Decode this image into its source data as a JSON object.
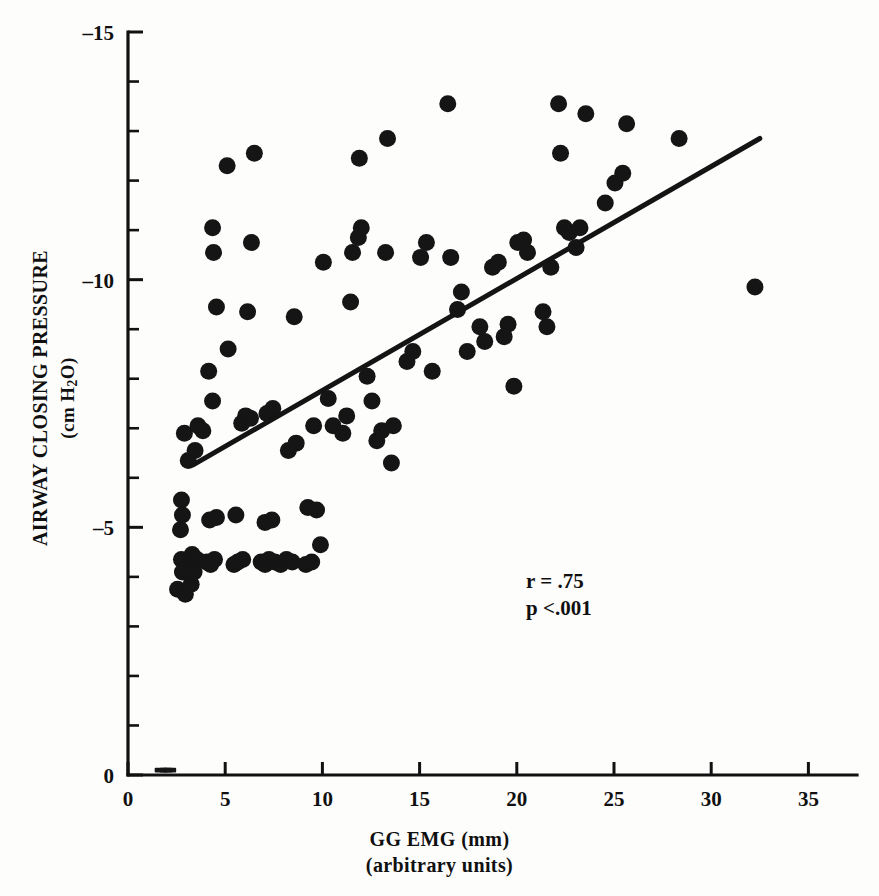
{
  "chart_data": {
    "type": "scatter",
    "title": "",
    "xlabel": "GG EMG (mm)",
    "xlabel_line2": "(arbitrary units)",
    "ylabel": "AIRWAY CLOSING PRESSURE",
    "ylabel_line2": "(cm H2O)",
    "ylabel_line2_pre": "(cm H",
    "ylabel_line2_sub": "2",
    "ylabel_line2_post": "O)",
    "xlim": [
      0,
      37.5
    ],
    "ylim": [
      -15,
      0
    ],
    "grid": false,
    "legend": null,
    "xticks": [
      0,
      5,
      10,
      15,
      20,
      25,
      30,
      35
    ],
    "xtick_labels": [
      "0",
      "5",
      "10",
      "15",
      "20",
      "25",
      "30",
      "35"
    ],
    "x_minor_step": 1,
    "yticks": [
      -15,
      -10,
      -5,
      0
    ],
    "ytick_labels": [
      "–15",
      "–10",
      "–5",
      "0"
    ],
    "y_minor_step": 1,
    "annotations": [
      {
        "name": "correlation",
        "text": "r = .75"
      },
      {
        "name": "p-value",
        "text": "p <.001"
      }
    ],
    "regression_line": {
      "x_start": 3.35,
      "y_start": -6.26,
      "x_end": 32.5,
      "y_end": -12.85
    },
    "marker_radius_px": 8.5,
    "point_color": "#151515",
    "line_color": "#141414",
    "points": [
      [
        1.7,
        -0.05
      ],
      [
        1.95,
        -0.05
      ],
      [
        2.15,
        -0.05
      ],
      [
        2.7,
        -4.95
      ],
      [
        2.8,
        -5.25
      ],
      [
        2.75,
        -5.55
      ],
      [
        2.75,
        -4.35
      ],
      [
        2.8,
        -4.1
      ],
      [
        3.05,
        -4.15
      ],
      [
        2.55,
        -3.75
      ],
      [
        2.95,
        -3.65
      ],
      [
        3.25,
        -3.85
      ],
      [
        3.3,
        -4.45
      ],
      [
        3.55,
        -4.35
      ],
      [
        3.4,
        -4.1
      ],
      [
        3.1,
        -6.35
      ],
      [
        3.45,
        -6.55
      ],
      [
        2.9,
        -6.9
      ],
      [
        3.6,
        -7.05
      ],
      [
        3.85,
        -6.95
      ],
      [
        4.05,
        -4.3
      ],
      [
        4.25,
        -4.25
      ],
      [
        4.45,
        -4.35
      ],
      [
        4.2,
        -5.15
      ],
      [
        4.55,
        -5.2
      ],
      [
        4.35,
        -7.55
      ],
      [
        4.15,
        -8.15
      ],
      [
        4.55,
        -9.45
      ],
      [
        4.4,
        -10.55
      ],
      [
        4.35,
        -11.05
      ],
      [
        5.1,
        -12.3
      ],
      [
        5.15,
        -8.6
      ],
      [
        5.45,
        -4.25
      ],
      [
        5.65,
        -4.3
      ],
      [
        5.9,
        -4.35
      ],
      [
        5.55,
        -5.25
      ],
      [
        5.85,
        -7.1
      ],
      [
        6.05,
        -7.25
      ],
      [
        6.3,
        -7.2
      ],
      [
        6.15,
        -9.35
      ],
      [
        6.35,
        -10.75
      ],
      [
        6.5,
        -12.55
      ],
      [
        6.85,
        -4.3
      ],
      [
        7.05,
        -4.25
      ],
      [
        7.25,
        -4.35
      ],
      [
        7.05,
        -5.1
      ],
      [
        7.4,
        -5.15
      ],
      [
        7.15,
        -7.3
      ],
      [
        7.45,
        -7.4
      ],
      [
        7.55,
        -4.3
      ],
      [
        7.85,
        -4.25
      ],
      [
        8.15,
        -4.35
      ],
      [
        8.45,
        -4.3
      ],
      [
        8.25,
        -6.55
      ],
      [
        8.65,
        -6.7
      ],
      [
        8.55,
        -9.25
      ],
      [
        9.15,
        -4.25
      ],
      [
        9.45,
        -4.3
      ],
      [
        9.25,
        -5.4
      ],
      [
        9.7,
        -5.35
      ],
      [
        9.55,
        -7.05
      ],
      [
        9.9,
        -4.65
      ],
      [
        10.05,
        -10.35
      ],
      [
        10.3,
        -7.6
      ],
      [
        10.55,
        -7.05
      ],
      [
        11.05,
        -6.9
      ],
      [
        11.25,
        -7.25
      ],
      [
        11.45,
        -9.55
      ],
      [
        11.55,
        -10.55
      ],
      [
        11.85,
        -10.85
      ],
      [
        12.0,
        -11.05
      ],
      [
        11.9,
        -12.45
      ],
      [
        12.3,
        -8.05
      ],
      [
        12.55,
        -7.55
      ],
      [
        12.8,
        -6.75
      ],
      [
        13.05,
        -6.95
      ],
      [
        13.25,
        -10.55
      ],
      [
        13.35,
        -12.85
      ],
      [
        13.55,
        -6.3
      ],
      [
        13.65,
        -7.05
      ],
      [
        14.35,
        -8.35
      ],
      [
        14.65,
        -8.55
      ],
      [
        15.05,
        -10.45
      ],
      [
        15.35,
        -10.75
      ],
      [
        15.65,
        -8.15
      ],
      [
        16.45,
        -13.55
      ],
      [
        16.6,
        -10.45
      ],
      [
        16.95,
        -9.4
      ],
      [
        17.15,
        -9.75
      ],
      [
        17.45,
        -8.55
      ],
      [
        18.1,
        -9.05
      ],
      [
        18.35,
        -8.75
      ],
      [
        18.75,
        -10.25
      ],
      [
        19.05,
        -10.35
      ],
      [
        19.35,
        -8.85
      ],
      [
        19.55,
        -9.1
      ],
      [
        19.85,
        -7.85
      ],
      [
        20.05,
        -10.75
      ],
      [
        20.35,
        -10.8
      ],
      [
        20.55,
        -10.55
      ],
      [
        21.35,
        -9.35
      ],
      [
        21.55,
        -9.05
      ],
      [
        21.75,
        -10.25
      ],
      [
        22.15,
        -13.55
      ],
      [
        22.25,
        -12.55
      ],
      [
        22.45,
        -11.05
      ],
      [
        22.7,
        -10.95
      ],
      [
        23.05,
        -10.65
      ],
      [
        23.25,
        -11.05
      ],
      [
        23.55,
        -13.35
      ],
      [
        24.55,
        -11.55
      ],
      [
        25.05,
        -11.95
      ],
      [
        25.45,
        -12.15
      ],
      [
        25.65,
        -13.15
      ],
      [
        28.35,
        -12.85
      ],
      [
        32.25,
        -9.85
      ]
    ]
  },
  "axes": {
    "x_axis_name": "x-axis",
    "y_axis_name": "y-axis"
  }
}
